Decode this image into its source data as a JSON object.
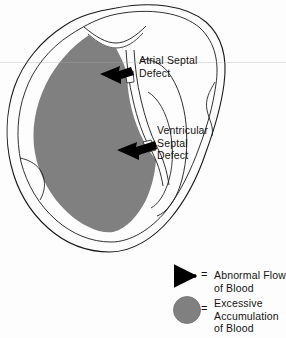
{
  "diagram": {
    "type": "medical-illustration",
    "background_color": "#fdfdfd",
    "outline_color": "#1a1a1a",
    "blood_fill_color": "#808080",
    "arrow_color": "#000000",
    "annotations": [
      {
        "id": "atrial-septal-defect",
        "label": "Atrial Septal\nDefect",
        "label_x": 139,
        "label_y": 54,
        "arrow_from_x": 138,
        "arrow_from_y": 83,
        "arrow_to_x": 104,
        "arrow_to_y": 76
      },
      {
        "id": "ventricular-septal-defect",
        "label": "Ventricular\nSeptal\nDefect",
        "label_x": 157,
        "label_y": 124,
        "arrow_from_x": 155,
        "arrow_from_y": 146,
        "arrow_to_x": 122,
        "arrow_to_y": 152
      }
    ]
  },
  "legend": {
    "equals_sign": "=",
    "items": [
      {
        "id": "abnormal-flow",
        "symbol": "left-arrow",
        "text": "Abnormal Flow\nof Blood"
      },
      {
        "id": "excessive-accumulation",
        "symbol": "gray-circle",
        "text": "Excessive\nAccumulation\nof Blood"
      }
    ]
  }
}
